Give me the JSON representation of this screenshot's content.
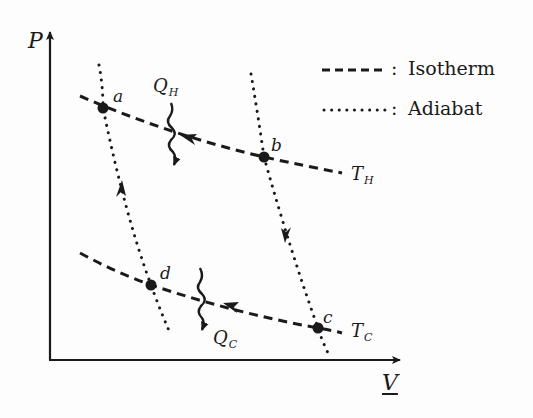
{
  "diagram": {
    "axes": {
      "y_label": "P",
      "x_label": "V"
    },
    "points": [
      {
        "id": "a",
        "label": "a"
      },
      {
        "id": "b",
        "label": "b"
      },
      {
        "id": "c",
        "label": "c"
      },
      {
        "id": "d",
        "label": "d"
      }
    ],
    "isotherms": {
      "hot": {
        "label_main": "T",
        "label_sub": "H"
      },
      "cold": {
        "label_main": "T",
        "label_sub": "C"
      }
    },
    "heat_flows": {
      "in": {
        "label_main": "Q",
        "label_sub": "H"
      },
      "out": {
        "label_main": "Q",
        "label_sub": "C"
      }
    },
    "legend": {
      "items": [
        {
          "style": "dashed",
          "symbol": "-----",
          "separator": ":",
          "text": "Isotherm"
        },
        {
          "style": "dotted",
          "symbol": "........",
          "separator": ":",
          "text": "Adiabat"
        }
      ]
    },
    "colors": {
      "ink": "#1a1a1a",
      "background": "#fdfdfd"
    }
  }
}
